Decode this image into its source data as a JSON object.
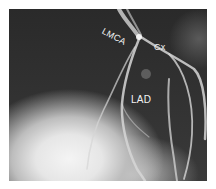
{
  "figure": {
    "labels": {
      "lmca": "LMCA",
      "cx": "Cx",
      "lad": "LAD"
    },
    "colors": {
      "background": "#2e2e2e",
      "vessel": "#d8d8d8",
      "label": "#f2f2f2",
      "border": "#ffffff"
    }
  }
}
